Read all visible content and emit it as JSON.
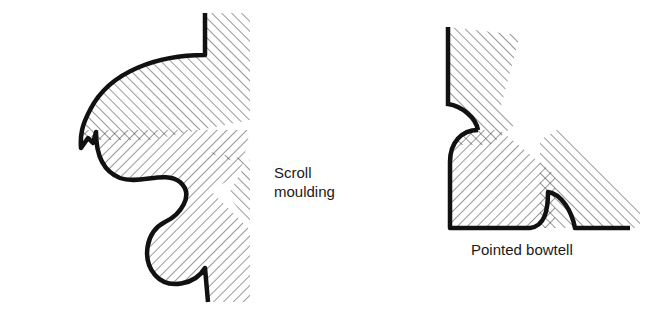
{
  "figures": [
    {
      "id": "scroll",
      "label_lines": [
        "Scroll",
        "moulding"
      ]
    },
    {
      "id": "bowtell",
      "label": "Pointed bowtell"
    }
  ],
  "colors": {
    "outline": "#111111",
    "hatch": "#333333",
    "background": "#ffffff"
  }
}
